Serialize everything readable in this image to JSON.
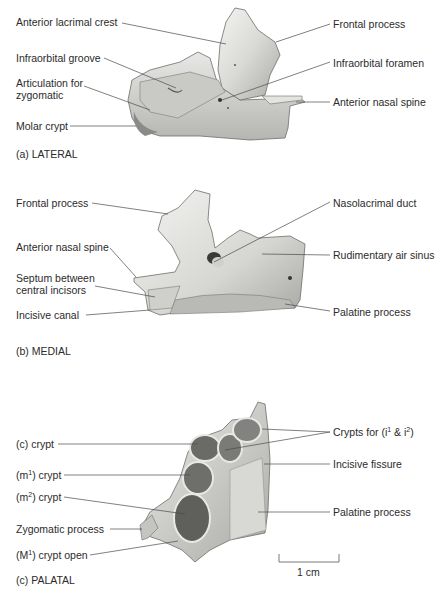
{
  "figure": {
    "panels": [
      {
        "id": "a",
        "caption": "(a) LATERAL",
        "labels_left": [
          {
            "text": "Anterior lacrimal crest"
          },
          {
            "text": "Infraorbital groove"
          },
          {
            "text": "Articulation for",
            "text2": "zygomatic"
          },
          {
            "text": "Molar crypt"
          }
        ],
        "labels_right": [
          {
            "text": "Frontal process"
          },
          {
            "text": "Infraorbital foramen"
          },
          {
            "text": "Anterior nasal spine"
          }
        ]
      },
      {
        "id": "b",
        "caption": "(b) MEDIAL",
        "labels_left": [
          {
            "text": "Frontal process"
          },
          {
            "text": "Anterior nasal spine"
          },
          {
            "text": "Septum between",
            "text2": "central incisors"
          },
          {
            "text": "Incisive canal"
          }
        ],
        "labels_right": [
          {
            "text": "Nasolacrimal duct"
          },
          {
            "text": "Rudimentary air sinus"
          },
          {
            "text": "Palatine process"
          }
        ]
      },
      {
        "id": "c",
        "caption": "(c) PALATAL",
        "labels_left": [
          {
            "text": "(c) crypt"
          },
          {
            "pre": "(m",
            "sup": "1",
            "post": ") crypt"
          },
          {
            "pre": "(m",
            "sup": "2",
            "post": ") crypt"
          },
          {
            "text": "Zygomatic process"
          },
          {
            "pre": "(M",
            "sup": "1",
            "post": ") crypt open"
          }
        ],
        "labels_right": [
          {
            "pre": "Crypts for (i",
            "sup": "1",
            "mid": " & i",
            "sup2": "2",
            "post": ")"
          },
          {
            "text": "Incisive fissure"
          },
          {
            "text": "Palatine process"
          }
        ],
        "scale_bar": {
          "label": "1 cm"
        }
      }
    ]
  }
}
